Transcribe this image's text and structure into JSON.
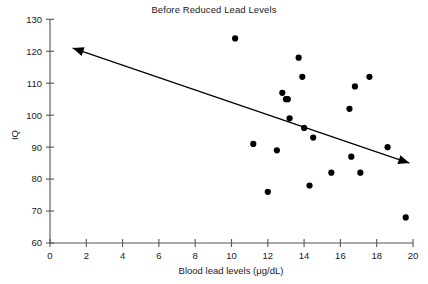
{
  "chart_data": {
    "type": "scatter",
    "title": "Before Reduced Lead Levels",
    "xlabel": "Blood lead levels (μg/dL)",
    "ylabel": "IQ",
    "xlim": [
      0,
      20
    ],
    "ylim": [
      60,
      130
    ],
    "xticks": [
      0,
      2,
      4,
      6,
      8,
      10,
      12,
      14,
      16,
      18,
      20
    ],
    "yticks": [
      60,
      70,
      80,
      90,
      100,
      110,
      120,
      130
    ],
    "grid": false,
    "legend": null,
    "marker": {
      "shape": "circle",
      "color": "#000000",
      "size": 5.2
    },
    "points": [
      {
        "x": 10.2,
        "y": 124
      },
      {
        "x": 11.2,
        "y": 91
      },
      {
        "x": 12.0,
        "y": 76
      },
      {
        "x": 12.5,
        "y": 89
      },
      {
        "x": 12.8,
        "y": 107
      },
      {
        "x": 13.0,
        "y": 105
      },
      {
        "x": 13.1,
        "y": 105
      },
      {
        "x": 13.2,
        "y": 99
      },
      {
        "x": 13.7,
        "y": 118
      },
      {
        "x": 13.9,
        "y": 112
      },
      {
        "x": 14.0,
        "y": 96
      },
      {
        "x": 14.3,
        "y": 78
      },
      {
        "x": 14.5,
        "y": 93
      },
      {
        "x": 15.5,
        "y": 82
      },
      {
        "x": 16.5,
        "y": 102
      },
      {
        "x": 16.6,
        "y": 87
      },
      {
        "x": 16.8,
        "y": 109
      },
      {
        "x": 17.1,
        "y": 82
      },
      {
        "x": 17.6,
        "y": 112
      },
      {
        "x": 18.6,
        "y": 90
      },
      {
        "x": 19.6,
        "y": 68
      }
    ],
    "trend": {
      "type": "double-headed-arrow",
      "from": {
        "x": 1.25,
        "y": 121
      },
      "to": {
        "x": 19.8,
        "y": 85
      },
      "direction": "negative",
      "color": "#000000"
    }
  },
  "axes": {
    "x_tick_labels": [
      "0",
      "2",
      "4",
      "6",
      "8",
      "10",
      "12",
      "14",
      "16",
      "18",
      "20"
    ],
    "y_tick_labels": [
      "60",
      "70",
      "80",
      "90",
      "100",
      "110",
      "120",
      "130"
    ],
    "x_axis_title": "Blood lead levels (μg/dL)",
    "y_axis_title": "IQ"
  },
  "colors": {
    "background": "#ffffff",
    "axis": "#555555",
    "text": "#1a1a1a",
    "marker": "#000000",
    "trend": "#000000"
  }
}
